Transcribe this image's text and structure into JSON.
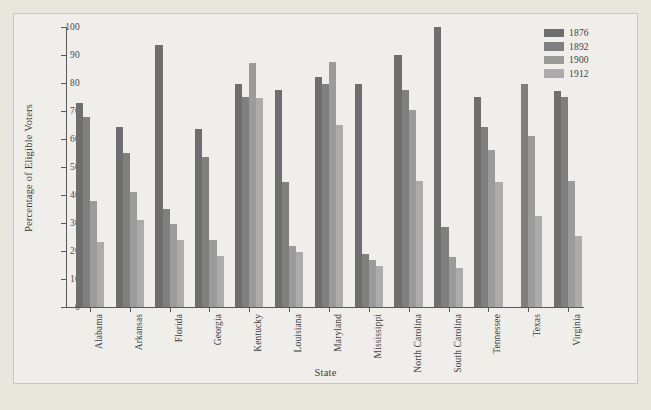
{
  "chart_data": {
    "type": "bar",
    "title": "",
    "xlabel": "State",
    "ylabel": "Percentage of Eligible Voters",
    "ylim": [
      0,
      100
    ],
    "ytick_step": 10,
    "yticks": [
      0,
      10,
      20,
      30,
      40,
      50,
      60,
      70,
      80,
      90,
      100
    ],
    "grid": false,
    "legend_position": "top-right",
    "categories": [
      "Alabama",
      "Arkansas",
      "Florida",
      "Georgia",
      "Kentucky",
      "Louisiana",
      "Maryland",
      "Mississippi",
      "North Carolina",
      "South Carolina",
      "Tennessee",
      "Texas",
      "Virginia"
    ],
    "series": [
      {
        "name": "1876",
        "color": "#6e6e6e",
        "values": [
          72.7,
          64.4,
          93.5,
          63.5,
          79.5,
          77.4,
          82.0,
          79.8,
          90.0,
          100.0,
          75.0,
          null,
          77.0
        ]
      },
      {
        "name": "1892",
        "color": "#7f7f7f",
        "values": [
          68.0,
          55.0,
          35.0,
          53.4,
          74.9,
          44.8,
          79.8,
          18.9,
          77.5,
          28.6,
          64.4,
          79.5,
          75.0
        ]
      },
      {
        "name": "1900",
        "color": "#9b9b9b",
        "values": [
          38.0,
          41.2,
          29.6,
          23.9,
          87.2,
          21.8,
          87.5,
          16.9,
          70.5,
          18.0,
          56.0,
          61.0,
          45.0
        ]
      },
      {
        "name": "1912",
        "color": "#ababab",
        "values": [
          23.2,
          31.0,
          24.0,
          18.2,
          74.8,
          19.7,
          65.0,
          14.8,
          45.0,
          14.0,
          44.8,
          32.5,
          25.5
        ]
      }
    ]
  },
  "legend": {
    "entries": [
      {
        "label": "1876",
        "color": "#6e6e6e"
      },
      {
        "label": "1892",
        "color": "#7f7f7f"
      },
      {
        "label": "1900",
        "color": "#9b9b9b"
      },
      {
        "label": "1912",
        "color": "#ababab"
      }
    ]
  },
  "colors": {
    "page_background": "#e9e6de",
    "panel_background": "#efeeea",
    "panel_border": "#c9c6bd",
    "axis": "#585858",
    "text": "#3d3d3d"
  }
}
